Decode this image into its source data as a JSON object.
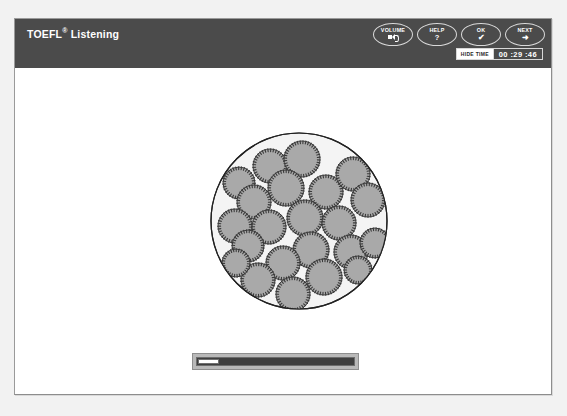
{
  "window": {
    "title_main": "TOEFL",
    "title_sup": "®",
    "title_section": " Listening"
  },
  "header": {
    "buttons": [
      {
        "label": "VOLUME",
        "glyph": "speaker-icon",
        "name": "volume-button"
      },
      {
        "label": "HELP",
        "glyph": "?",
        "name": "help-button"
      },
      {
        "label": "OK",
        "glyph": "✔",
        "name": "ok-button"
      },
      {
        "label": "NEXT",
        "glyph": "➜",
        "name": "next-button"
      }
    ],
    "hide_time_label": "HIDE TIME",
    "timer_value": "00 :29 :46"
  },
  "content": {
    "figure": {
      "name": "microscope-cells-illustration",
      "outer_circle_fill": "#f4f4f4",
      "outer_circle_stroke": "#222222",
      "cell_fill": "#a9a9a9",
      "cell_stroke": "#3a3a3a",
      "cell_count": 22,
      "cells": [
        {
          "cx": 62,
          "cy": 36,
          "r": 17
        },
        {
          "cx": 94,
          "cy": 29,
          "r": 18
        },
        {
          "cx": 31,
          "cy": 53,
          "r": 16
        },
        {
          "cx": 78,
          "cy": 58,
          "r": 18
        },
        {
          "cx": 118,
          "cy": 62,
          "r": 17
        },
        {
          "cx": 145,
          "cy": 44,
          "r": 17
        },
        {
          "cx": 46,
          "cy": 72,
          "r": 17
        },
        {
          "cx": 160,
          "cy": 70,
          "r": 17
        },
        {
          "cx": 27,
          "cy": 96,
          "r": 17
        },
        {
          "cx": 61,
          "cy": 97,
          "r": 17
        },
        {
          "cx": 97,
          "cy": 88,
          "r": 18
        },
        {
          "cx": 131,
          "cy": 93,
          "r": 17
        },
        {
          "cx": 40,
          "cy": 116,
          "r": 16
        },
        {
          "cx": 103,
          "cy": 120,
          "r": 18
        },
        {
          "cx": 143,
          "cy": 122,
          "r": 17
        },
        {
          "cx": 167,
          "cy": 113,
          "r": 15
        },
        {
          "cx": 75,
          "cy": 133,
          "r": 17
        },
        {
          "cx": 50,
          "cy": 150,
          "r": 17
        },
        {
          "cx": 116,
          "cy": 147,
          "r": 18
        },
        {
          "cx": 85,
          "cy": 164,
          "r": 17
        },
        {
          "cx": 150,
          "cy": 140,
          "r": 14
        },
        {
          "cx": 28,
          "cy": 133,
          "r": 14
        }
      ]
    },
    "progress": {
      "name": "audio-progress-bar",
      "position_percent": 1,
      "handle_label": ""
    }
  }
}
